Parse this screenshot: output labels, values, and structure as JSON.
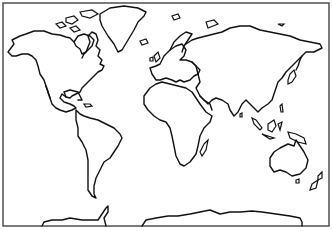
{
  "map": {
    "title": "World map outline",
    "projection": "equirectangular-like (Miller style)",
    "style": "black coastline outline on white, no labels",
    "colors": {
      "background": "#ffffff",
      "coastline": "#111111",
      "frame": "#444444"
    },
    "regions": [
      {
        "name": "North America"
      },
      {
        "name": "Greenland"
      },
      {
        "name": "South America"
      },
      {
        "name": "Europe"
      },
      {
        "name": "Africa"
      },
      {
        "name": "Asia"
      },
      {
        "name": "Australia"
      },
      {
        "name": "Antarctica"
      },
      {
        "name": "Madagascar"
      },
      {
        "name": "New Zealand"
      },
      {
        "name": "Indonesia"
      },
      {
        "name": "Japan"
      }
    ]
  }
}
